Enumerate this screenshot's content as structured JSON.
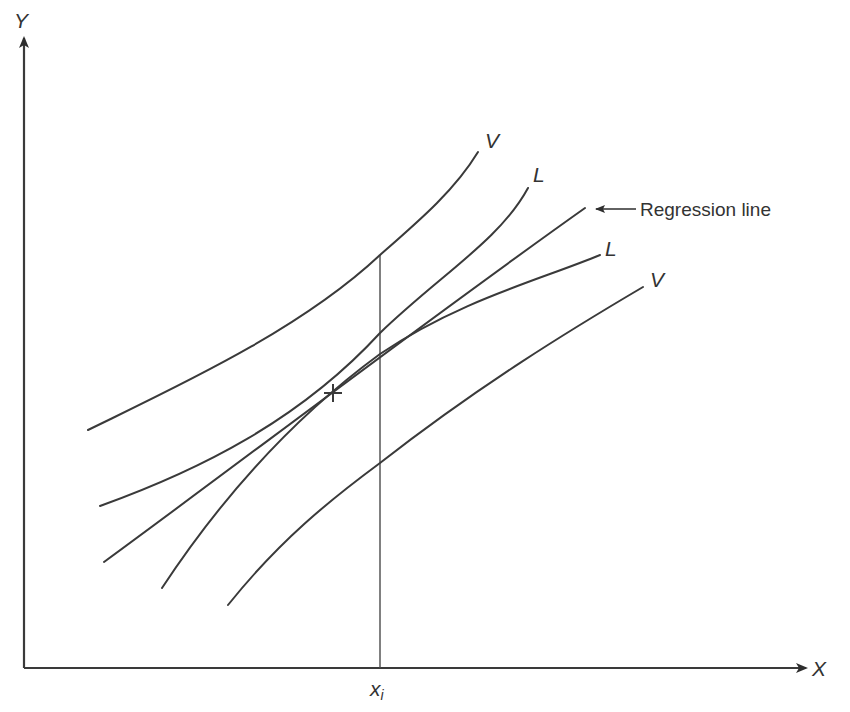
{
  "diagram": {
    "axes": {
      "y_label": "Y",
      "x_label": "X",
      "x_marker_label": "x",
      "x_marker_subscript": "i"
    },
    "curves": [
      {
        "id": "upper-v",
        "label": "V",
        "description": "Upper prediction band for individual values"
      },
      {
        "id": "upper-l",
        "label": "L",
        "description": "Upper confidence band for mean"
      },
      {
        "id": "regression",
        "label": "Regression line",
        "description": "Fitted regression line"
      },
      {
        "id": "lower-l",
        "label": "L",
        "description": "Lower confidence band for mean"
      },
      {
        "id": "lower-v",
        "label": "V",
        "description": "Lower prediction band for individual values"
      }
    ],
    "labels": {
      "upper_v": "V",
      "upper_l": "L",
      "regression": "Regression line",
      "lower_l": "L",
      "lower_v": "V"
    },
    "centroid_marker": "+",
    "colors": {
      "line": "#3a3a3a",
      "background": "#ffffff"
    }
  }
}
